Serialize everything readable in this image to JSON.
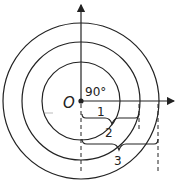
{
  "diagram": {
    "center_label": "O",
    "angle_label": "90°",
    "rings": [
      {
        "label": "1",
        "radius": 39
      },
      {
        "label": "2",
        "radius": 59
      },
      {
        "label": "3",
        "radius": 78
      }
    ],
    "colors": {
      "stroke": "#222222",
      "background": "#ffffff"
    }
  }
}
